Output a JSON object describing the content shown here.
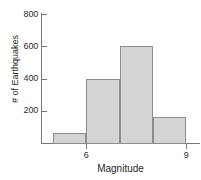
{
  "chart_data": {
    "type": "bar",
    "title": "",
    "subtitle": "",
    "xlabel": "Magnitude",
    "ylabel": "# of Earthquakes",
    "categories": [
      "5-6",
      "6-7",
      "7-8",
      "8-9"
    ],
    "bin_edges": [
      5,
      6,
      7,
      8,
      9
    ],
    "values": [
      60,
      400,
      600,
      160
    ],
    "series": [
      {
        "name": "# of Earthquakes",
        "values": [
          60,
          400,
          600,
          160
        ]
      }
    ],
    "xlim": [
      5,
      9
    ],
    "ylim": [
      0,
      830
    ],
    "x_ticks": [
      6,
      9
    ],
    "x_tick_labels": [
      "6",
      "9"
    ],
    "y_ticks": [
      200,
      400,
      600,
      800
    ],
    "y_tick_labels": [
      "200",
      "400",
      "600",
      "800"
    ],
    "grid": false,
    "legend": false,
    "legend_position": "none",
    "bar_fill_color": "#d4d4d4",
    "bar_border_color": "#8d8d8d",
    "axis_color": "#777777",
    "text_color": "#1f1f1f"
  }
}
